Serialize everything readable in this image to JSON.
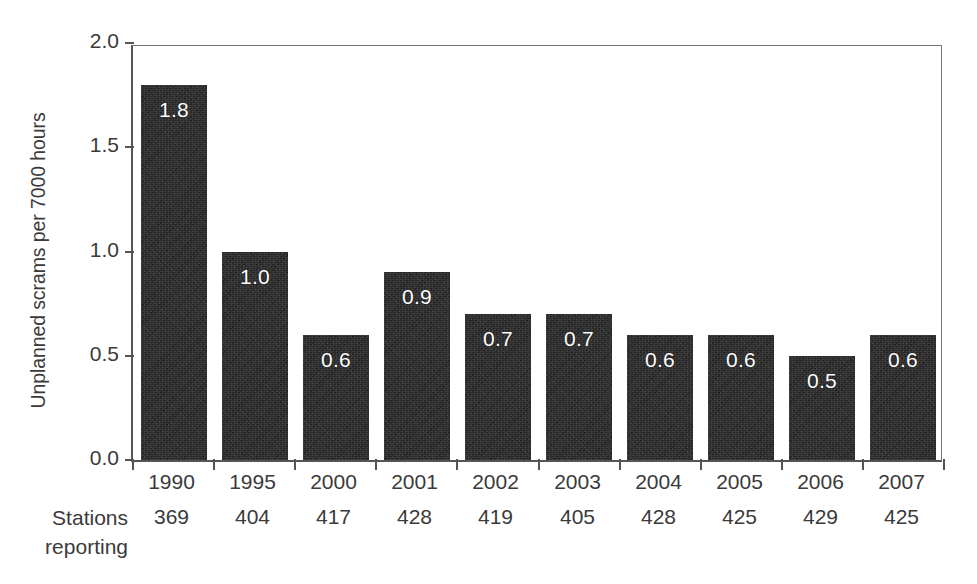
{
  "chart_data": {
    "type": "bar",
    "title": "",
    "xlabel": "",
    "ylabel": "Unplanned scrams per 7000 hours",
    "ylim": [
      0.0,
      2.0
    ],
    "ytick_labels": [
      "0.0",
      "0.5",
      "1.0",
      "1.5",
      "2.0"
    ],
    "ytick_values": [
      0.0,
      0.5,
      1.0,
      1.5,
      2.0
    ],
    "grid": false,
    "legend": "none",
    "categories": [
      "1990",
      "1995",
      "2000",
      "2001",
      "2002",
      "2003",
      "2004",
      "2005",
      "2006",
      "2007"
    ],
    "values": [
      1.8,
      1.0,
      0.6,
      0.9,
      0.7,
      0.7,
      0.6,
      0.6,
      0.5,
      0.6
    ],
    "value_labels": [
      "1.8",
      "1.0",
      "0.6",
      "0.9",
      "0.7",
      "0.7",
      "0.6",
      "0.6",
      "0.5",
      "0.6"
    ],
    "annotations": {
      "row_header_line1": "Stations",
      "row_header_line2": "reporting",
      "stations_reporting": [
        "369",
        "404",
        "417",
        "428",
        "419",
        "405",
        "428",
        "425",
        "429",
        "425"
      ]
    },
    "colors": {
      "bar": "#2b2b2b",
      "value_label": "#ffffff",
      "axis": "#555555",
      "text": "#3a3a3a",
      "background": "#ffffff"
    }
  }
}
